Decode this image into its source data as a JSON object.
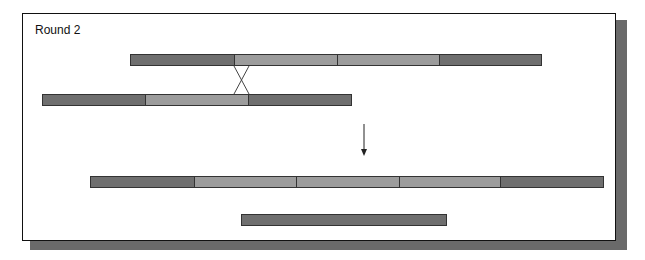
{
  "title": "Round 2",
  "colors": {
    "dark_segment": "#6f6f6f",
    "light_segment": "#9c9c9c",
    "outline": "#333333",
    "shadow": "#6a6a6a"
  },
  "chromosomes": [
    {
      "id": "top-parent",
      "x": 130,
      "y": 54,
      "segments": [
        "dark",
        "light",
        "light",
        "dark"
      ],
      "widths": [
        104,
        104,
        102,
        102
      ]
    },
    {
      "id": "bottom-parent",
      "x": 42,
      "y": 94,
      "segments": [
        "dark",
        "light",
        "dark"
      ],
      "widths": [
        104,
        103,
        103
      ]
    },
    {
      "id": "recombinant-long",
      "x": 90,
      "y": 176,
      "segments": [
        "dark",
        "light",
        "light",
        "light",
        "dark"
      ],
      "widths": [
        104,
        103,
        103,
        102,
        102
      ]
    },
    {
      "id": "recombinant-short",
      "x": 241,
      "y": 214,
      "segments": [
        "dark"
      ],
      "widths": [
        206
      ]
    }
  ],
  "crossover": {
    "x1": 234,
    "x2": 249,
    "y_top": 66,
    "y_bottom": 94
  },
  "arrow": {
    "x": 364,
    "y_start": 124,
    "y_end": 156,
    "direction": "down"
  }
}
